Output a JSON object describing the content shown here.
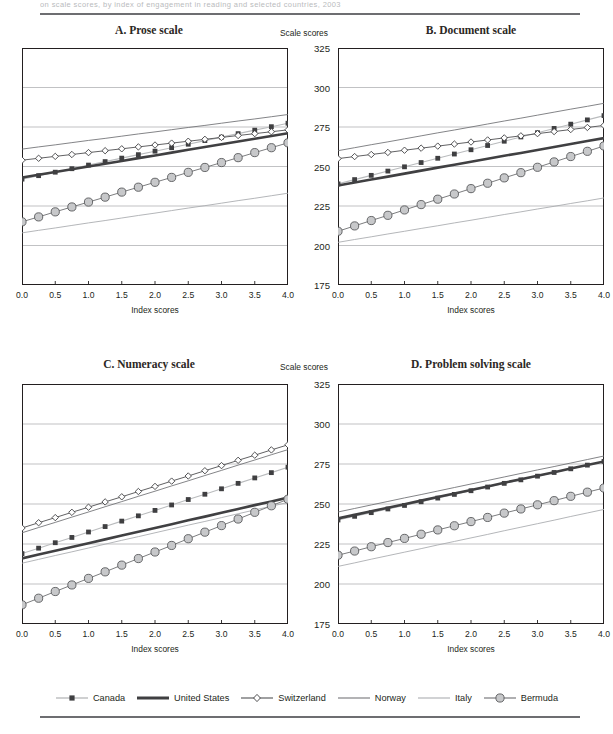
{
  "figure": {
    "top_cut_text": "on scale scores, by index of engagement in reading and selected countries, 2003",
    "y_axis_title": "Scale scores",
    "x_axis_title": "Index scores",
    "y_ticks": [
      "325",
      "300",
      "275",
      "250",
      "225",
      "200",
      "175"
    ],
    "x_ticks": [
      "0.0",
      "0.5",
      "1.0",
      "1.5",
      "2.0",
      "2.5",
      "3.0",
      "3.5",
      "4.0"
    ]
  },
  "legend": {
    "items": [
      {
        "label": "Canada",
        "key": "line-square-marker",
        "color": "#b5b7b9",
        "marker_color": "#3f3f41"
      },
      {
        "label": "United States",
        "key": "thick-line",
        "color": "#3f3f41",
        "marker_color": ""
      },
      {
        "label": "Switzerland",
        "key": "line-diamond-marker",
        "color": "#58595b",
        "marker_color": "#ffffff"
      },
      {
        "label": "Norway",
        "key": "thin-line",
        "color": "#6d6e71",
        "marker_color": ""
      },
      {
        "label": "Italy",
        "key": "thin-line",
        "color": "#939598",
        "marker_color": ""
      },
      {
        "label": "Bermuda",
        "key": "line-circle-marker",
        "color": "#6d6e71",
        "marker_color": "#c7c8ca"
      }
    ]
  },
  "chart_data": [
    {
      "id": "prose",
      "type": "line",
      "title": "A.  Prose scale",
      "xlabel": "Index scores",
      "ylabel": "Scale scores",
      "xlim": [
        0,
        4
      ],
      "ylim": [
        175,
        325
      ],
      "yticks": [
        175,
        200,
        225,
        250,
        275,
        300,
        325
      ],
      "xticks": [
        0,
        0.5,
        1,
        1.5,
        2,
        2.5,
        3,
        3.5,
        4
      ],
      "grid": true,
      "legend_position": "bottom-shared",
      "x": [
        0,
        0.25,
        0.5,
        0.75,
        1,
        1.25,
        1.5,
        1.75,
        2,
        2.25,
        2.5,
        2.75,
        3,
        3.25,
        3.5,
        3.75,
        4
      ],
      "series": [
        {
          "name": "Canada",
          "style": "line-square-marker",
          "values": [
            242.0,
            244.2,
            246.4,
            248.6,
            250.9,
            253.1,
            255.3,
            257.5,
            259.7,
            261.9,
            264.1,
            266.4,
            268.6,
            270.8,
            273.0,
            275.2,
            277.4
          ]
        },
        {
          "name": "United States",
          "style": "thick-line",
          "values": [
            243.0,
            244.8,
            246.5,
            248.3,
            250.0,
            251.8,
            253.5,
            255.3,
            257.0,
            258.8,
            260.6,
            262.3,
            264.1,
            265.8,
            267.6,
            269.3,
            271.1
          ]
        },
        {
          "name": "Switzerland",
          "style": "line-diamond-marker",
          "values": [
            254.0,
            255.2,
            256.4,
            257.6,
            258.8,
            260.0,
            261.2,
            262.4,
            263.6,
            264.8,
            266.0,
            267.2,
            268.4,
            269.6,
            270.8,
            272.0,
            273.2
          ]
        },
        {
          "name": "Norway",
          "style": "thin-line",
          "values": [
            261.0,
            262.4,
            263.7,
            265.1,
            266.5,
            267.8,
            269.2,
            270.6,
            271.9,
            273.3,
            274.7,
            276.0,
            277.4,
            278.8,
            280.1,
            281.5,
            282.9
          ]
        },
        {
          "name": "Italy",
          "style": "thin-line",
          "values": [
            208.0,
            209.6,
            211.1,
            212.7,
            214.3,
            215.8,
            217.4,
            219.0,
            220.5,
            222.1,
            223.7,
            225.2,
            226.8,
            228.4,
            229.9,
            231.5,
            233.1
          ]
        },
        {
          "name": "Bermuda",
          "style": "line-circle-marker",
          "values": [
            215.0,
            218.1,
            221.3,
            224.4,
            227.5,
            230.6,
            233.8,
            236.9,
            240.0,
            243.1,
            246.3,
            249.4,
            252.5,
            255.6,
            258.8,
            261.9,
            265.0
          ]
        }
      ]
    },
    {
      "id": "document",
      "type": "line",
      "title": "B.  Document scale",
      "xlabel": "Index scores",
      "ylabel": "Scale scores",
      "xlim": [
        0,
        4
      ],
      "ylim": [
        175,
        325
      ],
      "yticks": [
        175,
        200,
        225,
        250,
        275,
        300,
        325
      ],
      "xticks": [
        0,
        0.5,
        1,
        1.5,
        2,
        2.5,
        3,
        3.5,
        4
      ],
      "grid": true,
      "legend_position": "bottom-shared",
      "x": [
        0,
        0.25,
        0.5,
        0.75,
        1,
        1.25,
        1.5,
        1.75,
        2,
        2.25,
        2.5,
        2.75,
        3,
        3.25,
        3.5,
        3.75,
        4
      ],
      "series": [
        {
          "name": "Canada",
          "style": "line-square-marker",
          "values": [
            239.0,
            241.7,
            244.4,
            247.1,
            249.8,
            252.5,
            255.2,
            257.9,
            260.6,
            263.3,
            266.0,
            268.7,
            271.4,
            274.1,
            276.8,
            279.5,
            282.2
          ]
        },
        {
          "name": "United States",
          "style": "thick-line",
          "values": [
            238.0,
            239.9,
            241.8,
            243.6,
            245.5,
            247.4,
            249.3,
            251.1,
            253.0,
            254.9,
            256.8,
            258.6,
            260.5,
            262.4,
            264.3,
            266.1,
            268.0
          ]
        },
        {
          "name": "Switzerland",
          "style": "line-diamond-marker",
          "values": [
            255.0,
            256.3,
            257.6,
            258.9,
            260.3,
            261.6,
            262.9,
            264.2,
            265.5,
            266.8,
            268.1,
            269.4,
            270.8,
            272.1,
            273.4,
            274.7,
            276.0
          ]
        },
        {
          "name": "Norway",
          "style": "thin-line",
          "values": [
            260.0,
            261.9,
            263.8,
            265.6,
            267.5,
            269.4,
            271.3,
            273.1,
            275.0,
            276.9,
            278.8,
            280.6,
            282.5,
            284.4,
            286.3,
            288.1,
            290.0
          ]
        },
        {
          "name": "Italy",
          "style": "thin-line",
          "values": [
            202.0,
            203.8,
            205.5,
            207.3,
            209.0,
            210.8,
            212.5,
            214.3,
            216.0,
            217.8,
            219.6,
            221.3,
            223.1,
            224.8,
            226.6,
            228.3,
            230.1
          ]
        },
        {
          "name": "Bermuda",
          "style": "line-circle-marker",
          "values": [
            209.0,
            212.4,
            215.8,
            219.1,
            222.5,
            225.9,
            229.3,
            232.6,
            236.0,
            239.4,
            242.8,
            246.1,
            249.5,
            252.9,
            256.3,
            259.6,
            263.0
          ]
        }
      ]
    },
    {
      "id": "numeracy",
      "type": "line",
      "title": "C.  Numeracy scale",
      "xlabel": "Index scores",
      "ylabel": "Scale scores",
      "xlim": [
        0,
        4
      ],
      "ylim": [
        175,
        325
      ],
      "yticks": [
        175,
        200,
        225,
        250,
        275,
        300,
        325
      ],
      "xticks": [
        0,
        0.5,
        1,
        1.5,
        2,
        2.5,
        3,
        3.5,
        4
      ],
      "grid": true,
      "legend_position": "bottom-shared",
      "x": [
        0,
        0.25,
        0.5,
        0.75,
        1,
        1.25,
        1.5,
        1.75,
        2,
        2.25,
        2.5,
        2.75,
        3,
        3.25,
        3.5,
        3.75,
        4
      ],
      "series": [
        {
          "name": "Canada",
          "style": "line-square-marker",
          "values": [
            219.0,
            222.4,
            225.8,
            229.1,
            232.5,
            235.9,
            239.3,
            242.6,
            246.0,
            249.4,
            252.8,
            256.1,
            259.5,
            262.9,
            266.3,
            269.6,
            273.0
          ]
        },
        {
          "name": "United States",
          "style": "thick-line",
          "values": [
            216.0,
            218.4,
            220.8,
            223.1,
            225.5,
            227.9,
            230.3,
            232.6,
            235.0,
            237.4,
            239.8,
            242.1,
            244.5,
            246.9,
            249.3,
            251.6,
            254.0
          ]
        },
        {
          "name": "Switzerland",
          "style": "line-diamond-marker",
          "values": [
            235.0,
            238.3,
            241.5,
            244.8,
            248.0,
            251.3,
            254.5,
            257.8,
            261.0,
            264.3,
            267.5,
            270.8,
            274.0,
            277.3,
            280.5,
            283.8,
            287.0
          ]
        },
        {
          "name": "Norway",
          "style": "thin-line",
          "values": [
            232.0,
            235.3,
            238.5,
            241.8,
            245.0,
            248.3,
            251.5,
            254.8,
            258.0,
            261.3,
            264.5,
            267.8,
            271.0,
            274.3,
            277.5,
            280.8,
            284.0
          ]
        },
        {
          "name": "Italy",
          "style": "thin-line",
          "values": [
            213.0,
            215.4,
            217.8,
            220.1,
            222.5,
            224.9,
            227.3,
            229.6,
            232.0,
            234.4,
            236.8,
            239.1,
            241.5,
            243.9,
            246.3,
            248.6,
            251.0
          ]
        },
        {
          "name": "Bermuda",
          "style": "line-circle-marker",
          "values": [
            187.0,
            191.1,
            195.3,
            199.4,
            203.5,
            207.6,
            211.8,
            215.9,
            220.0,
            224.1,
            228.3,
            232.4,
            236.5,
            240.6,
            244.8,
            248.9,
            253.0
          ]
        }
      ]
    },
    {
      "id": "problem-solving",
      "type": "line",
      "title": "D.  Problem solving scale",
      "xlabel": "Index scores",
      "ylabel": "Scale scores",
      "xlim": [
        0,
        4
      ],
      "ylim": [
        175,
        325
      ],
      "yticks": [
        175,
        200,
        225,
        250,
        275,
        300,
        325
      ],
      "xticks": [
        0,
        0.5,
        1,
        1.5,
        2,
        2.5,
        3,
        3.5,
        4
      ],
      "grid": true,
      "legend_position": "bottom-shared",
      "x": [
        0,
        0.25,
        0.5,
        0.75,
        1,
        1.25,
        1.5,
        1.75,
        2,
        2.25,
        2.5,
        2.75,
        3,
        3.25,
        3.5,
        3.75,
        4
      ],
      "series": [
        {
          "name": "Canada",
          "style": "line-square-marker",
          "values": [
            240.0,
            242.3,
            244.6,
            246.9,
            249.1,
            251.4,
            253.7,
            256.0,
            258.3,
            260.6,
            262.9,
            265.1,
            267.4,
            269.7,
            272.0,
            274.3,
            276.6
          ]
        },
        {
          "name": "United States",
          "style": "thick-line",
          "values": [
            241.0,
            243.2,
            245.5,
            247.7,
            249.9,
            252.1,
            254.4,
            256.6,
            258.8,
            261.0,
            263.3,
            265.5,
            267.7,
            269.9,
            272.2,
            274.4,
            276.6
          ]
        },
        {
          "name": "Norway",
          "style": "thin-line",
          "values": [
            245.0,
            247.2,
            249.4,
            251.6,
            253.8,
            255.9,
            258.1,
            260.3,
            262.5,
            264.7,
            266.9,
            269.1,
            271.3,
            273.4,
            275.6,
            277.8,
            280.0
          ]
        },
        {
          "name": "Italy",
          "style": "thin-line",
          "values": [
            211.0,
            213.2,
            215.5,
            217.7,
            219.9,
            222.1,
            224.4,
            226.6,
            228.8,
            231.0,
            233.3,
            235.5,
            237.7,
            239.9,
            242.2,
            244.4,
            246.6
          ]
        },
        {
          "name": "Bermuda",
          "style": "line-circle-marker",
          "values": [
            218.0,
            220.6,
            223.3,
            225.9,
            228.5,
            231.1,
            233.8,
            236.4,
            239.0,
            241.6,
            244.3,
            246.9,
            249.5,
            252.1,
            254.8,
            257.4,
            260.0
          ]
        }
      ]
    }
  ]
}
